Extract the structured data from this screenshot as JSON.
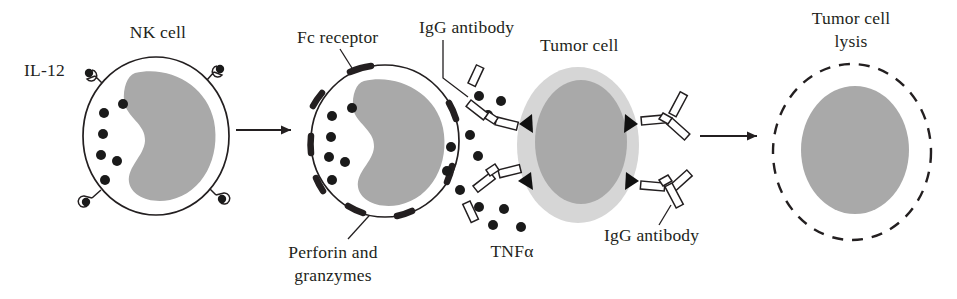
{
  "figure": {
    "background_color": "#ffffff",
    "ink_color": "#231f20"
  },
  "labels": {
    "il12": "IL-12",
    "nk_cell": "NK cell",
    "fc_receptor": "Fc receptor",
    "perforin_granzymes_line1": "Perforin and",
    "perforin_granzymes_line2": "granzymes",
    "igg_antibody_top": "IgG antibody",
    "tnf_alpha": "TNFα",
    "tumor_cell": "Tumor cell",
    "igg_antibody_bottom": "IgG antibody",
    "tumor_cell_lysis_line1": "Tumor cell",
    "tumor_cell_lysis_line2": "lysis"
  },
  "colors": {
    "nucleus_gray": "#a9a9a9",
    "tumor_cytoplasm_gray": "#d6d6d6",
    "tumor_nucleus_gray": "#a9a9a9",
    "lysed_nucleus_gray": "#a9a9a9",
    "outline": "#231f20",
    "cell_fill": "#ffffff"
  },
  "stages": [
    {
      "id": "resting-nk-cell",
      "name": "NK cell",
      "description": "Resting NK cell with IL-12 receptors and cytoplasmic granules"
    },
    {
      "id": "activated-nk-cell",
      "name": "Activated NK cell",
      "description": "NK cell with Fc receptors binding IgG antibody, releasing perforin, granzymes and TNF alpha"
    },
    {
      "id": "tumor-cell",
      "name": "Tumor cell",
      "description": "Tumor cell coated with IgG antibody bound to surface antigens"
    },
    {
      "id": "lysed-tumor-cell",
      "name": "Tumor cell lysis",
      "description": "Lysed tumor cell shown as dashed membrane with remaining nucleus"
    }
  ],
  "counts": {
    "il12_receptors": 4,
    "nk_granules_cell1": 6,
    "nk_granules_cell2": 6,
    "fc_receptors": 8,
    "igg_antibodies_left": 2,
    "igg_antibodies_right": 2,
    "antigen_triangles": 4,
    "tnf_dots": 12
  }
}
